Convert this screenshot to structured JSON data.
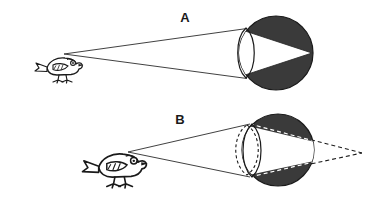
{
  "figure": {
    "background_color": "#ffffff",
    "width": 370,
    "height": 201
  },
  "colors": {
    "eye_fill": "#3a3a3a",
    "eye_outline": "#1a1a1a",
    "ray_solid": "#2b2b2b",
    "ray_dashed_inside": "#ffffff",
    "ray_dashed_outside": "#1a1a1a",
    "lens_outline": "#1a1a1a",
    "lens_dashed": "#1a1a1a",
    "bird_ink": "#1a1a1a",
    "label_text": "#1a1a1a",
    "cone_fill": "#ffffff"
  },
  "panels": [
    {
      "id": "panel-a",
      "label": "A",
      "label_pos": {
        "x": 185,
        "y": 22
      },
      "condition": "distant object, relaxed lens, image focused on retina",
      "object": {
        "name": "bird",
        "kind": "small-bird-silhouette",
        "facing": "right",
        "pos": {
          "x": 45,
          "y": 52
        },
        "scale": 1.0,
        "eye_point": {
          "x": 64,
          "y": 54
        }
      },
      "eye": {
        "center": {
          "x": 276,
          "y": 53
        },
        "radius": 37,
        "lens": {
          "center": {
            "x": 246,
            "y": 53
          },
          "half_width": 11,
          "half_height": 25,
          "style": "solid",
          "shape": "biconvex-narrow"
        },
        "focal_point": {
          "x": 310,
          "y": 53
        },
        "focus_location": "on retina"
      },
      "rays": {
        "style": "solid",
        "from": {
          "x": 64,
          "y": 54
        },
        "to_upper": {
          "x": 246,
          "y": 28
        },
        "to_lower": {
          "x": 246,
          "y": 78
        },
        "cone_apex": {
          "x": 310,
          "y": 53
        },
        "inside_style": "solid-edge"
      }
    },
    {
      "id": "panel-b",
      "label": "B",
      "label_pos": {
        "x": 180,
        "y": 124
      },
      "condition": "near object, lens must accommodate, unaccommodated image falls behind retina",
      "object": {
        "name": "bird",
        "kind": "small-bird-silhouette",
        "facing": "right",
        "pos": {
          "x": 96,
          "y": 146
        },
        "scale": 1.35,
        "eye_point": {
          "x": 128,
          "y": 152
        }
      },
      "eye": {
        "center": {
          "x": 278,
          "y": 150
        },
        "radius": 36,
        "lens": {
          "center": {
            "x": 250,
            "y": 150
          },
          "half_width": 12,
          "half_height": 26,
          "style": "solid",
          "shape": "biconvex-narrow"
        },
        "lens_accommodated": {
          "center": {
            "x": 247,
            "y": 150
          },
          "half_width": 15,
          "half_height": 25,
          "style": "dashed",
          "shape": "biconvex-round"
        },
        "focal_point": {
          "x": 356,
          "y": 152
        },
        "focus_location": "behind retina"
      },
      "rays": {
        "style": "solid-outside-dashed-inside",
        "from": {
          "x": 128,
          "y": 152
        },
        "to_upper": {
          "x": 248,
          "y": 124
        },
        "to_lower": {
          "x": 248,
          "y": 176
        },
        "retina_upper": {
          "x": 308,
          "y": 140
        },
        "retina_lower": {
          "x": 308,
          "y": 164
        },
        "cone_apex": {
          "x": 356,
          "y": 152
        },
        "inside_style": "dashed-white",
        "outside_style": "dashed-black"
      }
    }
  ]
}
